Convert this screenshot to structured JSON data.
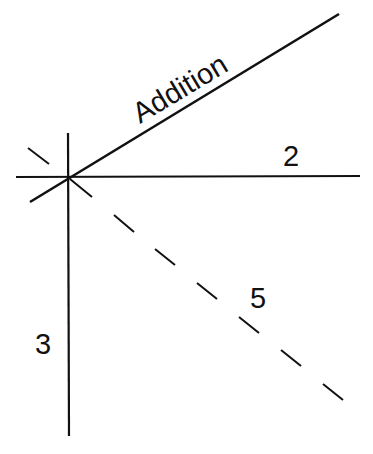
{
  "diagram": {
    "labels": {
      "addition": "Addition",
      "horizontal": "2",
      "dashed": "5",
      "vertical": "3"
    },
    "colors": {
      "stroke": "#111111",
      "background": "#ffffff"
    }
  }
}
